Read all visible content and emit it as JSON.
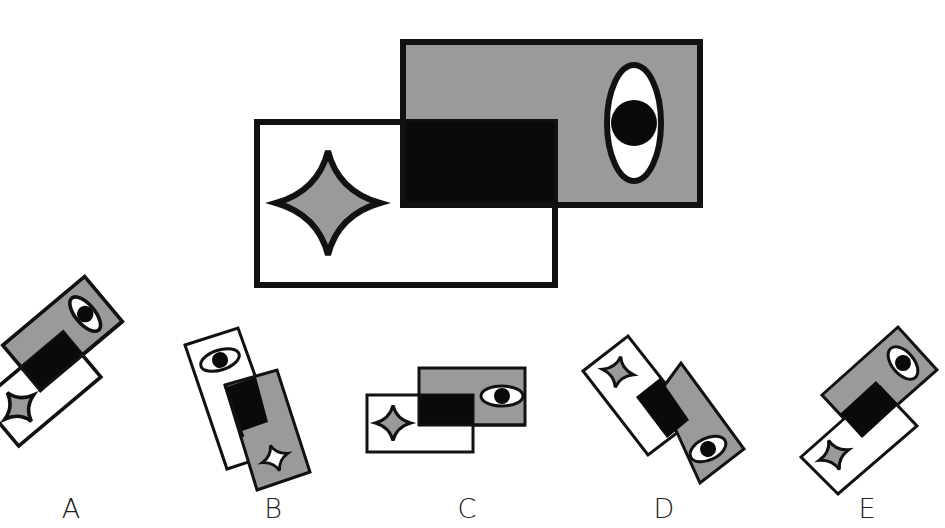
{
  "puzzle": {
    "type": "spatial-reasoning",
    "prompt_figure": {
      "description": "Two overlapping rectangles: a gray rectangle (upper right) containing a vertical eye, and a white rectangle (lower left) containing a gray four-pointed star; overlap region is black.",
      "colors": {
        "gray": "#9a9a9a",
        "black": "#0a0a0a",
        "white": "#ffffff",
        "stroke": "#111111"
      }
    },
    "options": [
      {
        "id": "A",
        "label": "A",
        "description": "Rotated version: gray rect with eye on top-right, white rect with star bottom-left, black overlap"
      },
      {
        "id": "B",
        "label": "B",
        "description": "White rect with eye, gray rect with white star (colors swapped)"
      },
      {
        "id": "C",
        "label": "C",
        "description": "Unrotated with horizontal eye"
      },
      {
        "id": "D",
        "label": "D",
        "description": "White rect with star on top-left, gray rect with eye on lower-right"
      },
      {
        "id": "E",
        "label": "E",
        "description": "Rotated version: gray rect with eye top-right, white rect with star bottom-left"
      }
    ]
  }
}
